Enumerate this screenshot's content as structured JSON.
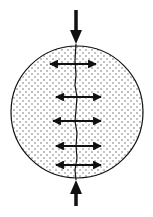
{
  "diagram": {
    "colors": {
      "background": "#ffffff",
      "stroke": "#111111",
      "dots": "#555555"
    },
    "specimen": {
      "shape": "circle",
      "cx": 77,
      "cy": 112,
      "r": 66,
      "fill_pattern": "dots"
    },
    "loads": [
      {
        "name": "top-compression-arrow",
        "direction": "down",
        "x": 76,
        "y_start": 10,
        "y_end": 44
      },
      {
        "name": "bottom-compression-arrow",
        "direction": "up",
        "x": 76,
        "y_start": 206,
        "y_end": 180
      }
    ],
    "tension_arrows": [
      {
        "y": 64,
        "x1": 50,
        "x2": 96
      },
      {
        "y": 97,
        "x1": 56,
        "x2": 101
      },
      {
        "y": 121,
        "x1": 53,
        "x2": 101
      },
      {
        "y": 146,
        "x1": 56,
        "x2": 101
      },
      {
        "y": 165,
        "x1": 56,
        "x2": 101
      }
    ],
    "crack": {
      "points": "76,44 75,60 76,75 75,85 77,97 76,110 75,121 77,133 76,146 77,158 75,170 76,180"
    }
  }
}
